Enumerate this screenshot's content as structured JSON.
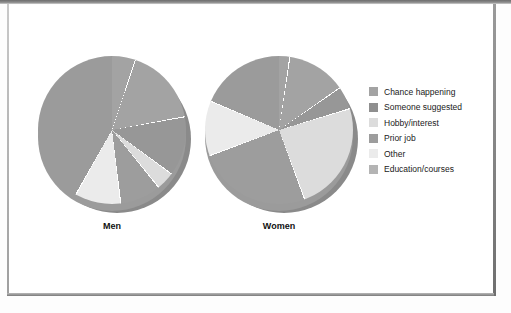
{
  "chart_data": {
    "type": "pie",
    "title": "",
    "categories": [
      "Chance happening",
      "Someone suggested",
      "Hobby/interest",
      "Prior job",
      "Other",
      "Education/courses"
    ],
    "colors": [
      "#a3a3a3",
      "#979797",
      "#dcdcdc",
      "#9d9d9d",
      "#ebebeb",
      "#b0b0b0"
    ],
    "legend_position": "right",
    "grid": false,
    "series": [
      {
        "name": "Men",
        "label": "Men",
        "values": [
          17,
          13,
          4,
          9,
          10,
          47
        ],
        "slice_colors": [
          "#a3a3a3",
          "#979797",
          "#dcdcdc",
          "#9d9d9d",
          "#ebebeb",
          "#9b9b9b"
        ]
      },
      {
        "name": "Women",
        "label": "Women",
        "values": [
          13,
          5,
          24,
          25,
          12,
          21
        ],
        "slice_colors": [
          "#a3a3a3",
          "#979797",
          "#dcdcdc",
          "#9d9d9d",
          "#ebebeb",
          "#9b9b9b"
        ]
      }
    ]
  },
  "legend": {
    "items": [
      {
        "label": "Chance happening",
        "color": "#a3a3a3"
      },
      {
        "label": "Someone suggested",
        "color": "#8f8f8f"
      },
      {
        "label": "Hobby/interest",
        "color": "#dcdcdc"
      },
      {
        "label": "Prior job",
        "color": "#9d9d9d"
      },
      {
        "label": "Other",
        "color": "#ebebeb"
      },
      {
        "label": "Education/courses",
        "color": "#b4b4b4"
      }
    ]
  },
  "pies": {
    "men": {
      "label": "Men"
    },
    "women": {
      "label": "Women"
    }
  }
}
